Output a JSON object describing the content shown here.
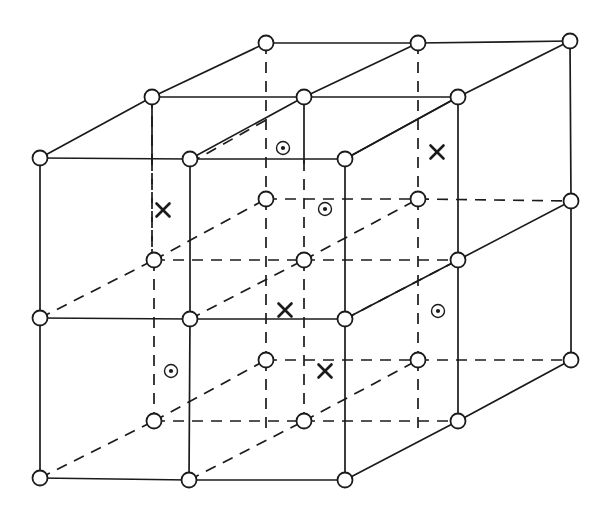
{
  "figure": {
    "width": 608,
    "height": 516,
    "background_color": "#ffffff",
    "line_color": "#1b1b1b",
    "node_fill": "#ffffff"
  },
  "geometry": {
    "node_radius": 7.5,
    "solid_stroke_width": 1.7,
    "dashed_pattern": "11 8"
  },
  "nodes": [
    {
      "name": "back-top-left",
      "x": 152,
      "y": 97,
      "layer": "back",
      "row": "top"
    },
    {
      "name": "back-top-mid",
      "x": 266,
      "y": 43,
      "layer": "back",
      "row": "top"
    },
    {
      "name": "back-top-midright",
      "x": 304,
      "y": 97,
      "layer": "back",
      "row": "top"
    },
    {
      "name": "back-top-right",
      "x": 418,
      "y": 43,
      "layer": "back",
      "row": "top"
    },
    {
      "name": "back-top-far",
      "x": 458,
      "y": 97,
      "layer": "back",
      "row": "top"
    },
    {
      "name": "back-top-farright",
      "x": 570,
      "y": 41,
      "layer": "back",
      "row": "top"
    },
    {
      "name": "front-top-left",
      "x": 40,
      "y": 158,
      "layer": "front",
      "row": "top"
    },
    {
      "name": "front-top-mid",
      "x": 190,
      "y": 159,
      "layer": "front",
      "row": "top"
    },
    {
      "name": "front-top-right",
      "x": 345,
      "y": 159,
      "layer": "front",
      "row": "top"
    },
    {
      "name": "right-top",
      "x": 571,
      "y": 201,
      "layer": "right",
      "row": "top"
    },
    {
      "name": "mid-back-left",
      "x": 266,
      "y": 199,
      "layer": "back",
      "row": "middle"
    },
    {
      "name": "mid-back-right",
      "x": 418,
      "y": 199,
      "layer": "back",
      "row": "middle"
    },
    {
      "name": "mid-plane-left",
      "x": 154,
      "y": 260,
      "layer": "middle",
      "row": "middle"
    },
    {
      "name": "mid-plane-center",
      "x": 304,
      "y": 260,
      "layer": "middle",
      "row": "middle"
    },
    {
      "name": "mid-plane-right",
      "x": 458,
      "y": 260,
      "layer": "middle",
      "row": "middle"
    },
    {
      "name": "front-mid-left",
      "x": 40,
      "y": 318,
      "layer": "front",
      "row": "middle"
    },
    {
      "name": "front-mid-mid",
      "x": 190,
      "y": 319,
      "layer": "front",
      "row": "middle"
    },
    {
      "name": "front-mid-right",
      "x": 345,
      "y": 319,
      "layer": "front",
      "row": "middle"
    },
    {
      "name": "right-mid",
      "x": 571,
      "y": 360,
      "layer": "right",
      "row": "middle"
    },
    {
      "name": "low-back-left",
      "x": 266,
      "y": 360,
      "layer": "back",
      "row": "lower"
    },
    {
      "name": "low-back-right",
      "x": 418,
      "y": 360,
      "layer": "back",
      "row": "lower"
    },
    {
      "name": "low-plane-left",
      "x": 154,
      "y": 421,
      "layer": "middle",
      "row": "lower"
    },
    {
      "name": "low-plane-center",
      "x": 304,
      "y": 421,
      "layer": "middle",
      "row": "lower"
    },
    {
      "name": "low-plane-right",
      "x": 458,
      "y": 421,
      "layer": "middle",
      "row": "lower"
    },
    {
      "name": "front-bottom-left",
      "x": 40,
      "y": 478,
      "layer": "front",
      "row": "bottom"
    },
    {
      "name": "front-bottom-mid",
      "x": 189,
      "y": 480,
      "layer": "front",
      "row": "bottom"
    },
    {
      "name": "front-bottom-right",
      "x": 345,
      "y": 480,
      "layer": "front",
      "row": "bottom"
    }
  ],
  "solid_edges": [
    {
      "name": "top-back-horizontal-left",
      "x1": 266,
      "y1": 43,
      "x2": 418,
      "y2": 43
    },
    {
      "name": "top-back-horizontal-right",
      "x1": 418,
      "y1": 43,
      "x2": 570,
      "y2": 41
    },
    {
      "name": "top-mid-horizontal-left",
      "x1": 152,
      "y1": 97,
      "x2": 304,
      "y2": 97
    },
    {
      "name": "top-mid-horizontal-right",
      "x1": 304,
      "y1": 97,
      "x2": 458,
      "y2": 97
    },
    {
      "name": "top-front-horizontal-left",
      "x1": 40,
      "y1": 158,
      "x2": 190,
      "y2": 159
    },
    {
      "name": "top-front-horizontal-right",
      "x1": 190,
      "y1": 159,
      "x2": 345,
      "y2": 159
    },
    {
      "name": "oblique-top-a",
      "x1": 40,
      "y1": 158,
      "x2": 152,
      "y2": 97
    },
    {
      "name": "oblique-top-b",
      "x1": 152,
      "y1": 97,
      "x2": 266,
      "y2": 43
    },
    {
      "name": "oblique-top-c",
      "x1": 190,
      "y1": 159,
      "x2": 304,
      "y2": 97
    },
    {
      "name": "oblique-top-d",
      "x1": 304,
      "y1": 97,
      "x2": 418,
      "y2": 43
    },
    {
      "name": "oblique-top-e",
      "x1": 345,
      "y1": 159,
      "x2": 458,
      "y2": 97
    },
    {
      "name": "oblique-top-f",
      "x1": 458,
      "y1": 97,
      "x2": 570,
      "y2": 41
    },
    {
      "name": "oblique-right-upper",
      "x1": 345,
      "y1": 159,
      "x2": 458,
      "y2": 97
    },
    {
      "name": "oblique-mid-right",
      "x1": 345,
      "y1": 319,
      "x2": 458,
      "y2": 260
    },
    {
      "name": "oblique-mid-right-2",
      "x1": 458,
      "y1": 260,
      "x2": 571,
      "y2": 201
    },
    {
      "name": "oblique-bottom-right",
      "x1": 345,
      "y1": 480,
      "x2": 458,
      "y2": 421
    },
    {
      "name": "oblique-bottom-right-2",
      "x1": 458,
      "y1": 421,
      "x2": 571,
      "y2": 360
    },
    {
      "name": "vert-front-left",
      "x1": 40,
      "y1": 158,
      "x2": 40,
      "y2": 318
    },
    {
      "name": "vert-front-left-lower",
      "x1": 40,
      "y1": 318,
      "x2": 40,
      "y2": 478
    },
    {
      "name": "vert-front-mid",
      "x1": 190,
      "y1": 159,
      "x2": 190,
      "y2": 319
    },
    {
      "name": "vert-front-mid-lower",
      "x1": 190,
      "y1": 319,
      "x2": 189,
      "y2": 480
    },
    {
      "name": "vert-front-right",
      "x1": 345,
      "y1": 159,
      "x2": 345,
      "y2": 319
    },
    {
      "name": "vert-front-right-lower",
      "x1": 345,
      "y1": 319,
      "x2": 345,
      "y2": 480
    },
    {
      "name": "vert-back-topleft",
      "x1": 152,
      "y1": 97,
      "x2": 152,
      "y2": 163
    },
    {
      "name": "vert-back-topmid",
      "x1": 304,
      "y1": 97,
      "x2": 304,
      "y2": 163
    },
    {
      "name": "vert-back-topright",
      "x1": 458,
      "y1": 97,
      "x2": 458,
      "y2": 260
    },
    {
      "name": "vert-far-right",
      "x1": 570,
      "y1": 41,
      "x2": 571,
      "y2": 201
    },
    {
      "name": "vert-far-right-lower",
      "x1": 571,
      "y1": 201,
      "x2": 571,
      "y2": 360
    },
    {
      "name": "mid-front-horizontal-left",
      "x1": 40,
      "y1": 318,
      "x2": 190,
      "y2": 319
    },
    {
      "name": "mid-front-horizontal-right",
      "x1": 190,
      "y1": 319,
      "x2": 345,
      "y2": 319
    },
    {
      "name": "bottom-front-horizontal-l",
      "x1": 40,
      "y1": 478,
      "x2": 189,
      "y2": 480
    },
    {
      "name": "bottom-front-horizontal-r",
      "x1": 189,
      "y1": 480,
      "x2": 345,
      "y2": 480
    },
    {
      "name": "vert-mid-plane-right",
      "x1": 458,
      "y1": 260,
      "x2": 458,
      "y2": 421
    }
  ],
  "dashed_edges": [
    {
      "name": "hidden-vert-backmid-top",
      "x1": 266,
      "y1": 43,
      "x2": 266,
      "y2": 199
    },
    {
      "name": "hidden-vert-backright-top",
      "x1": 418,
      "y1": 43,
      "x2": 418,
      "y2": 199
    },
    {
      "name": "hidden-vert-backmid-lower",
      "x1": 266,
      "y1": 199,
      "x2": 266,
      "y2": 360
    },
    {
      "name": "hidden-vert-backright-low",
      "x1": 418,
      "y1": 199,
      "x2": 418,
      "y2": 360
    },
    {
      "name": "hidden-vert-backmid-bot",
      "x1": 266,
      "y1": 360,
      "x2": 266,
      "y2": 430
    },
    {
      "name": "hidden-vert-backright-bot",
      "x1": 418,
      "y1": 360,
      "x2": 418,
      "y2": 430
    },
    {
      "name": "hidden-vert-left-upper",
      "x1": 152,
      "y1": 160,
      "x2": 152,
      "y2": 260
    },
    {
      "name": "hidden-vert-left-mid",
      "x1": 154,
      "y1": 260,
      "x2": 154,
      "y2": 421
    },
    {
      "name": "hidden-vert-center-upper",
      "x1": 304,
      "y1": 160,
      "x2": 304,
      "y2": 260
    },
    {
      "name": "hidden-vert-center-mid",
      "x1": 304,
      "y1": 260,
      "x2": 304,
      "y2": 421
    },
    {
      "name": "hidden-horiz-mid-back",
      "x1": 266,
      "y1": 199,
      "x2": 418,
      "y2": 199
    },
    {
      "name": "hidden-horiz-mid-back-r",
      "x1": 418,
      "y1": 199,
      "x2": 571,
      "y2": 201
    },
    {
      "name": "hidden-horiz-midplane",
      "x1": 154,
      "y1": 260,
      "x2": 304,
      "y2": 260
    },
    {
      "name": "hidden-horiz-midplane-r",
      "x1": 304,
      "y1": 260,
      "x2": 458,
      "y2": 260
    },
    {
      "name": "hidden-horiz-low-back",
      "x1": 266,
      "y1": 360,
      "x2": 418,
      "y2": 360
    },
    {
      "name": "hidden-horiz-low-back-r",
      "x1": 418,
      "y1": 360,
      "x2": 571,
      "y2": 360
    },
    {
      "name": "hidden-horiz-lowplane",
      "x1": 154,
      "y1": 421,
      "x2": 304,
      "y2": 421
    },
    {
      "name": "hidden-horiz-lowplane-r",
      "x1": 304,
      "y1": 421,
      "x2": 458,
      "y2": 421
    },
    {
      "name": "hidden-obl-a",
      "x1": 40,
      "y1": 318,
      "x2": 154,
      "y2": 260
    },
    {
      "name": "hidden-obl-b",
      "x1": 154,
      "y1": 260,
      "x2": 266,
      "y2": 199
    },
    {
      "name": "hidden-obl-c",
      "x1": 190,
      "y1": 319,
      "x2": 304,
      "y2": 260
    },
    {
      "name": "hidden-obl-d",
      "x1": 304,
      "y1": 260,
      "x2": 418,
      "y2": 199
    },
    {
      "name": "hidden-obl-e",
      "x1": 345,
      "y1": 319,
      "x2": 458,
      "y2": 260
    },
    {
      "name": "hidden-obl-f",
      "x1": 40,
      "y1": 478,
      "x2": 154,
      "y2": 421
    },
    {
      "name": "hidden-obl-g",
      "x1": 154,
      "y1": 421,
      "x2": 266,
      "y2": 360
    },
    {
      "name": "hidden-obl-h",
      "x1": 189,
      "y1": 480,
      "x2": 304,
      "y2": 421
    },
    {
      "name": "hidden-obl-i",
      "x1": 304,
      "y1": 421,
      "x2": 418,
      "y2": 360
    },
    {
      "name": "hidden-obl-j",
      "x1": 190,
      "y1": 163,
      "x2": 266,
      "y2": 120
    },
    {
      "name": "hidden-vert-leftcol-top",
      "x1": 152,
      "y1": 97,
      "x2": 152,
      "y2": 260
    }
  ],
  "markers": [
    {
      "name": "spin-up-marker-1",
      "glyph": "circle-dot",
      "x": 283,
      "y": 148,
      "label": "⊙"
    },
    {
      "name": "spin-down-marker-1",
      "glyph": "cross",
      "x": 437,
      "y": 152,
      "label": "✕"
    },
    {
      "name": "spin-down-marker-2",
      "glyph": "cross",
      "x": 163,
      "y": 210,
      "label": "✕"
    },
    {
      "name": "spin-up-marker-2",
      "glyph": "circle-dot",
      "x": 325,
      "y": 209,
      "label": "⊙"
    },
    {
      "name": "spin-down-marker-3",
      "glyph": "cross",
      "x": 285,
      "y": 310,
      "label": "✕"
    },
    {
      "name": "spin-up-marker-3",
      "glyph": "circle-dot",
      "x": 438,
      "y": 311,
      "label": "⊙"
    },
    {
      "name": "spin-up-marker-4",
      "glyph": "circle-dot",
      "x": 171,
      "y": 371,
      "label": "⊙"
    },
    {
      "name": "spin-down-marker-4",
      "glyph": "cross",
      "x": 325,
      "y": 371,
      "label": "✕"
    }
  ],
  "marker_style": {
    "circle_dot_outer_radius": 6.5,
    "circle_dot_inner_radius": 2.1,
    "cross_half_size": 6.5
  }
}
